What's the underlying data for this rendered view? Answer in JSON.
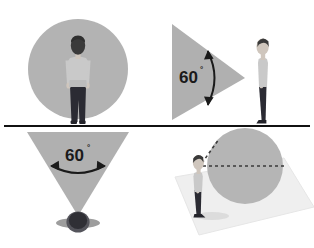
{
  "figure": {
    "type": "diagram",
    "background_color": "#ffffff",
    "divider": {
      "name": "horizontal-divider-line",
      "color": "#111111",
      "y": 126,
      "thickness": 2.2,
      "x_start": 4,
      "x_end": 310
    },
    "palette": {
      "cone_gray": "#b0b0b0",
      "circle_gray": "#b3b3b3",
      "sphere_gray": "#b5b5b5",
      "ground_plane_gray": "#efefef",
      "ground_plane_edge": "#e2e2e2",
      "shirt_gray": "#c9c9c9",
      "shirt_shadow": "#b0b0b0",
      "skin_gray": "#cfc6bd",
      "hair_dark": "#3a3a3a",
      "pants_dark": "#2b2b33",
      "shoe_dark": "#23232a",
      "arrow_dark": "#1a1a1a",
      "label_dark": "#1a1a1a",
      "shadow_gray": "#bdbdbd"
    }
  },
  "panels": [
    {
      "id": "top-left",
      "name": "panel-front-view-circle",
      "description": "Front view of a standing person inside a gray circle",
      "shapes": {
        "circle": {
          "cx": 78,
          "cy": 69,
          "r": 50,
          "fill": "#b3b3b3"
        },
        "person": {
          "pose": "front-facing-standing",
          "cx": 78,
          "ground_y": 124
        }
      },
      "angle_label": null
    },
    {
      "id": "top-right",
      "name": "panel-side-view-cone",
      "description": "Side view: 60 degree cone with apex at the person's eye",
      "shapes": {
        "cone_triangle": {
          "apex_x": 245,
          "apex_y": 78,
          "base_x": 172,
          "base_top_y": 24,
          "base_bottom_y": 120,
          "fill": "#b0b0b0"
        },
        "person": {
          "pose": "side-profile-standing-facing-left",
          "cx": 263,
          "ground_y": 124
        }
      },
      "angle_label": {
        "text": "60",
        "degree_symbol": "°",
        "x": 190,
        "y": 80
      }
    },
    {
      "id": "bottom-left",
      "name": "panel-top-view-cone",
      "description": "Top-down view: 60 degree cone with apex at the person's head",
      "shapes": {
        "cone_triangle": {
          "apex_x": 78,
          "apex_y": 216,
          "base_y": 132,
          "base_left_x": 27,
          "base_right_x": 129,
          "fill": "#b0b0b0"
        },
        "person": {
          "pose": "top-down-head-and-shoulders",
          "cx": 78,
          "cy": 222
        }
      },
      "angle_label": {
        "text": "60",
        "degree_symbol": "°",
        "x": 78,
        "y": 163
      }
    },
    {
      "id": "bottom-right",
      "name": "panel-perspective-sphere",
      "description": "Perspective view: person on a ground plane sighting a gray sphere along dashed lines",
      "shapes": {
        "ground_plane": {
          "fill": "#efefef",
          "points": "175,176 283,158 314,206 200,234"
        },
        "sphere": {
          "cx": 245,
          "cy": 166,
          "r": 38,
          "fill": "#b5b5b5"
        },
        "person": {
          "pose": "side-profile-standing-facing-right",
          "cx": 198,
          "ground_y": 218
        },
        "sight_lines": [
          {
            "name": "dashed-line-to-sphere-center",
            "x1": 203,
            "y1": 166,
            "x2": 288,
            "y2": 166,
            "style": "dashed"
          },
          {
            "name": "dashed-line-to-sphere-top",
            "x1": 203,
            "y1": 166,
            "x2": 218,
            "y2": 140,
            "style": "dashed"
          }
        ]
      },
      "angle_label": null
    }
  ],
  "labels": {
    "angle_value": "60",
    "degree_symbol": "°"
  },
  "arrows": {
    "top_right_arc": {
      "name": "double-headed-arc-arrow-vertical",
      "color": "#1a1a1a"
    },
    "bottom_left_arc": {
      "name": "double-headed-arc-arrow-horizontal",
      "color": "#1a1a1a"
    }
  }
}
